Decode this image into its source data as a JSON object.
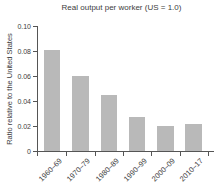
{
  "chart_data": {
    "type": "bar",
    "title": "Real output per worker (US = 1.0)",
    "ylabel": "Ratio relative to the United States",
    "xlabel": "",
    "categories": [
      "1960–69",
      "1970–79",
      "1980–89",
      "1990–99",
      "2000–09",
      "2010–17"
    ],
    "values": [
      0.081,
      0.06,
      0.045,
      0.027,
      0.02,
      0.022
    ],
    "ylim": [
      0,
      0.1
    ],
    "yticks": [
      {
        "value": 0,
        "label": "0"
      },
      {
        "value": 0.02,
        "label": "0.02"
      },
      {
        "value": 0.04,
        "label": "0.04"
      },
      {
        "value": 0.06,
        "label": "0.06"
      },
      {
        "value": 0.08,
        "label": "0.08"
      },
      {
        "value": 0.1,
        "label": "0.10"
      }
    ],
    "grid": false,
    "legend_position": "none",
    "bar_color": "#b9b9b9",
    "axis_color": "#555555",
    "text_color": "#3d3d3d"
  }
}
